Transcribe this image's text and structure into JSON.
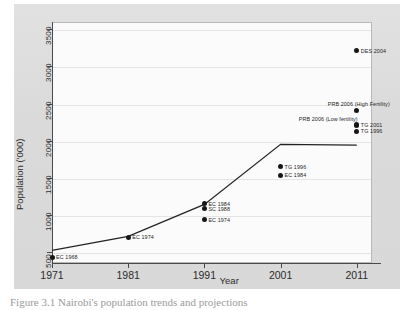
{
  "figure": {
    "caption": "Figure 3.1   Nairobi's population trends and projections"
  },
  "chart_data": {
    "type": "line",
    "title": "",
    "xlabel": "Year",
    "ylabel": "Population ('000)",
    "xlim": [
      1971,
      2013
    ],
    "ylim": [
      350,
      3600
    ],
    "xticks": [
      "1971",
      "1981",
      "1991",
      "2001",
      "2011"
    ],
    "yticks": [
      "500",
      "1000",
      "1500",
      "2000",
      "2500",
      "3000",
      "3500"
    ],
    "grid": "horizontal",
    "legend": "none",
    "series": [
      {
        "name": "Population trend",
        "x": [
          1971,
          1981,
          1991,
          2001,
          2011
        ],
        "values": [
          520,
          710,
          1140,
          1950,
          1940
        ]
      }
    ],
    "points": [
      {
        "label": "EC 1968",
        "x": 1971,
        "y": 430,
        "label_pos": "right"
      },
      {
        "label": "EC 1974",
        "x": 1981,
        "y": 700,
        "label_pos": "right"
      },
      {
        "label": "EC 1984",
        "x": 1991,
        "y": 1150,
        "label_pos": "right"
      },
      {
        "label": "SC 1988",
        "x": 1991,
        "y": 1080,
        "label_pos": "right"
      },
      {
        "label": "EC 1974",
        "x": 1991,
        "y": 930,
        "label_pos": "right"
      },
      {
        "label": "TG 1996",
        "x": 2001,
        "y": 1650,
        "label_pos": "right"
      },
      {
        "label": "EC 1984",
        "x": 2001,
        "y": 1530,
        "label_pos": "right"
      },
      {
        "label": "DES 2004",
        "x": 2011,
        "y": 3210,
        "label_pos": "right"
      },
      {
        "label": "PRB 2006 (High Fertility)",
        "x": 2011,
        "y": 2410,
        "label_pos": "above"
      },
      {
        "label": "PRB 2006 (Low fertility)",
        "x": 2011,
        "y": 2220,
        "label_pos": "above-right"
      },
      {
        "label": "TG 2001",
        "x": 2011,
        "y": 2210,
        "label_pos": "right"
      },
      {
        "label": "TG 1996",
        "x": 2011,
        "y": 2130,
        "label_pos": "right"
      }
    ]
  }
}
